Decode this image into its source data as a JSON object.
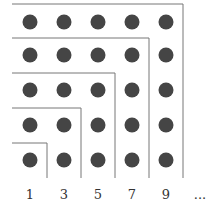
{
  "diagram": {
    "grid_size": 5,
    "dot_color": "#454545",
    "line_color": "#777777",
    "labels": [
      "1",
      "3",
      "5",
      "7",
      "9",
      "..."
    ]
  }
}
